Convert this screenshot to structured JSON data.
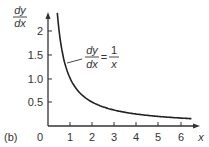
{
  "chart_data": {
    "type": "line",
    "title": "",
    "panel_label": "(b)",
    "xlabel": "x",
    "ylabel": {
      "numerator": "dy",
      "denominator": "dx"
    },
    "xlim": [
      0,
      6.5
    ],
    "ylim": [
      0,
      2.4
    ],
    "x_ticks": [
      "1",
      "2",
      "3",
      "4",
      "5",
      "6"
    ],
    "y_ticks": [
      "0.5",
      "1.0",
      "1.5",
      "2"
    ],
    "origin_label": "0",
    "grid": false,
    "series": [
      {
        "name": "dy/dx = 1/x",
        "x": [
          0.42,
          0.5,
          0.6,
          0.75,
          1.0,
          1.5,
          2.0,
          2.5,
          3.0,
          4.0,
          5.0,
          6.0,
          6.5
        ],
        "values": [
          2.38,
          2.0,
          1.667,
          1.333,
          1.0,
          0.667,
          0.5,
          0.4,
          0.333,
          0.25,
          0.2,
          0.167,
          0.154
        ]
      }
    ],
    "annotations": [
      {
        "text_numerator": "dy",
        "text_denominator": "dx",
        "equals": "=",
        "rhs_numerator": "1",
        "rhs_denominator": "x",
        "points_to_x": 0.85
      }
    ]
  }
}
